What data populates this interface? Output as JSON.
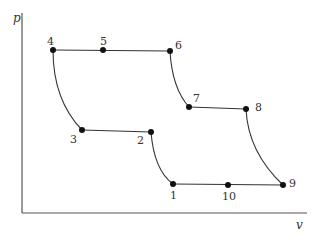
{
  "diagram": {
    "title": "",
    "axes": {
      "x_label": "v",
      "y_label": "p"
    },
    "points": [
      {
        "id": "1",
        "x": 173,
        "y": 184
      },
      {
        "id": "2",
        "x": 151,
        "y": 132
      },
      {
        "id": "3",
        "x": 82,
        "y": 130
      },
      {
        "id": "4",
        "x": 53,
        "y": 50
      },
      {
        "id": "5",
        "x": 103,
        "y": 50
      },
      {
        "id": "6",
        "x": 170,
        "y": 51
      },
      {
        "id": "7",
        "x": 189,
        "y": 107
      },
      {
        "id": "8",
        "x": 246,
        "y": 109
      },
      {
        "id": "9",
        "x": 283,
        "y": 185
      },
      {
        "id": "10",
        "x": 228,
        "y": 185
      }
    ],
    "labels": {
      "p1": "1",
      "p2": "2",
      "p3": "3",
      "p4": "4",
      "p5": "5",
      "p6": "6",
      "p7": "7",
      "p8": "8",
      "p9": "9",
      "p10": "10"
    },
    "colors": {
      "line": "#333333",
      "point": "#111111",
      "axis": "#555555"
    }
  }
}
